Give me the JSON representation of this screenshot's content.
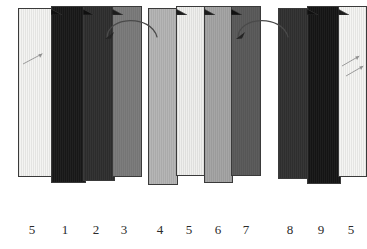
{
  "figure": {
    "background_color": "#ffffff",
    "outline_color": "#3a3a3a",
    "label_color": "#2b2b2b"
  },
  "groups": [
    {
      "id": "group-left",
      "name": "left-stack",
      "x": 18,
      "bars": [
        {
          "label": "5",
          "color": "#f4f4f2",
          "x": 0,
          "y": 8,
          "w": 36,
          "h": 169,
          "tab": false,
          "dark": false,
          "label_x": 14
        },
        {
          "label": "1",
          "color": "#171717",
          "x": 33,
          "y": 6,
          "w": 35,
          "h": 177,
          "tab": true,
          "dark": true,
          "label_x": 47
        },
        {
          "label": "2",
          "color": "#2c2c2c",
          "x": 65,
          "y": 6,
          "w": 32,
          "h": 175,
          "tab": true,
          "dark": true,
          "label_x": 78
        },
        {
          "label": "3",
          "color": "#7d7d7d",
          "x": 94,
          "y": 6,
          "w": 30,
          "h": 171,
          "tab": true,
          "dark": false,
          "label_x": 106
        }
      ],
      "annotations": [
        {
          "type": "diagonal-arrow",
          "x": 5,
          "y": 52,
          "len": 22,
          "angle": -28
        }
      ]
    },
    {
      "id": "group-middle",
      "name": "middle-stack",
      "x": 148,
      "bars": [
        {
          "label": "4",
          "color": "#b6b6b6",
          "x": 0,
          "y": 8,
          "w": 30,
          "h": 177,
          "tab": false,
          "dark": false,
          "label_x": 12
        },
        {
          "label": "5",
          "color": "#efefed",
          "x": 28,
          "y": 6,
          "w": 30,
          "h": 170,
          "tab": true,
          "dark": false,
          "label_x": 41
        },
        {
          "label": "6",
          "color": "#a6a6a6",
          "x": 56,
          "y": 6,
          "w": 29,
          "h": 177,
          "tab": true,
          "dark": false,
          "label_x": 70
        },
        {
          "label": "7",
          "color": "#565656",
          "x": 83,
          "y": 6,
          "w": 30,
          "h": 170,
          "tab": true,
          "dark": true,
          "label_x": 98
        }
      ],
      "annotations": []
    },
    {
      "id": "group-right",
      "name": "right-stack",
      "x": 278,
      "bars": [
        {
          "label": "8",
          "color": "#2e2e2e",
          "x": 0,
          "y": 8,
          "w": 32,
          "h": 171,
          "tab": false,
          "dark": true,
          "label_x": 12
        },
        {
          "label": "9",
          "color": "#141414",
          "x": 29,
          "y": 6,
          "w": 34,
          "h": 178,
          "tab": true,
          "dark": true,
          "label_x": 43
        },
        {
          "label": "5",
          "color": "#f5f5f3",
          "x": 60,
          "y": 6,
          "w": 29,
          "h": 171,
          "tab": true,
          "dark": false,
          "label_x": 73
        }
      ],
      "annotations": [
        {
          "type": "diagonal-arrow",
          "x": 64,
          "y": 54,
          "len": 20,
          "angle": -30
        },
        {
          "type": "diagonal-arrow",
          "x": 68,
          "y": 64,
          "len": 20,
          "angle": -30
        }
      ]
    }
  ],
  "arrows": [
    {
      "id": "arrow-left-to-middle",
      "name": "rotation-arrow-1",
      "x": 101,
      "y": 12,
      "w": 58,
      "h": 28,
      "direction": "counterclockwise"
    },
    {
      "id": "arrow-middle-to-right",
      "name": "rotation-arrow-2",
      "x": 232,
      "y": 12,
      "w": 58,
      "h": 28,
      "direction": "counterclockwise"
    }
  ],
  "labels_row": {
    "y": 222,
    "items": [
      "5",
      "1",
      "2",
      "3",
      "4",
      "5",
      "6",
      "7",
      "8",
      "9",
      "5"
    ]
  }
}
